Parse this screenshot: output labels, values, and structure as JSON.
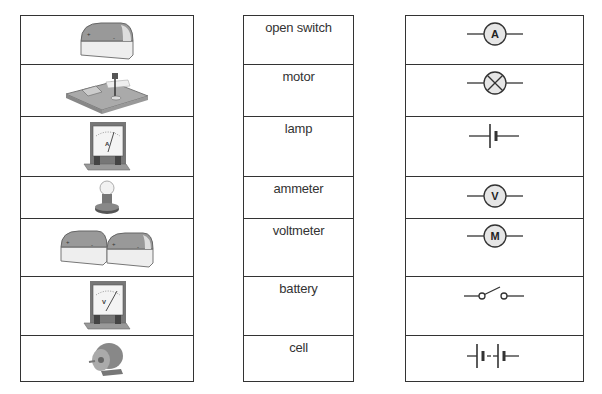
{
  "rows": [
    {
      "image": "cell-icon",
      "name": "open switch",
      "symbol": "ammeter-symbol",
      "height": 49
    },
    {
      "image": "switch-icon",
      "name": "motor",
      "symbol": "lamp-symbol",
      "height": 52
    },
    {
      "image": "ammeter-icon",
      "name": "lamp",
      "symbol": "cell-symbol",
      "height": 60
    },
    {
      "image": "lamp-icon",
      "name": "ammeter",
      "symbol": "voltmeter-symbol",
      "height": 42
    },
    {
      "image": "battery-icon",
      "name": "voltmeter",
      "symbol": "motor-symbol",
      "height": 58
    },
    {
      "image": "voltmeter-icon",
      "name": "battery",
      "symbol": "open-switch-symbol",
      "height": 59
    },
    {
      "image": "motor-icon",
      "name": "cell",
      "symbol": "battery-symbol",
      "height": 45
    }
  ],
  "symbol_letters": {
    "ammeter": "A",
    "voltmeter": "V",
    "motor": "M"
  },
  "meter_labels": {
    "ammeter": "A",
    "voltmeter": "V"
  },
  "colors": {
    "border": "#333333",
    "symbol_fill": "#e6e6e6",
    "text": "#333333"
  }
}
